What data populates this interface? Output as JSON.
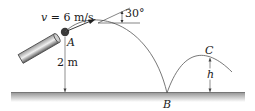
{
  "diagram": {
    "type": "projectile-motion",
    "labels": {
      "velocity": "v = 6 m/s",
      "angle": "30°",
      "point_a": "A",
      "point_b": "B",
      "point_c": "C",
      "height_launch": "2 m",
      "height_c": "h"
    },
    "colors": {
      "ground": "#8a8a8a",
      "ground_shade": "#d4d4d4",
      "lines": "#333333",
      "cannon": "#555555",
      "ball": "#3a3a3a"
    }
  }
}
